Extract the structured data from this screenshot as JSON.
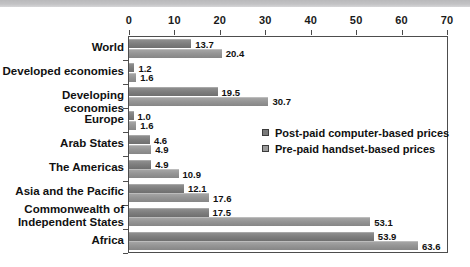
{
  "chart_data": {
    "type": "bar",
    "orientation": "horizontal",
    "title": "",
    "subtitle": "",
    "xlabel": "",
    "ylabel": "",
    "xlim": [
      0,
      70
    ],
    "xticks": [
      0,
      10,
      20,
      30,
      40,
      50,
      60,
      70
    ],
    "xtick_labels": [
      "0",
      "10",
      "20",
      "30",
      "40",
      "50",
      "60",
      "70"
    ],
    "grid": false,
    "legend_position": "inside-right",
    "categories": [
      "World",
      "Developed economies",
      "Developing economies",
      "Europe",
      "Arab States",
      "The Americas",
      "Asia and the Pacific",
      "Commonwealth of\nIndependent States",
      "Africa"
    ],
    "series": [
      {
        "name": "Post-paid computer-based prices",
        "color": "#7a7a7a",
        "values": [
          13.7,
          1.2,
          19.5,
          1.0,
          4.6,
          4.9,
          12.1,
          17.5,
          53.9
        ],
        "value_labels": [
          "13.7",
          "1.2",
          "19.5",
          "1.0",
          "4.6",
          "4.9",
          "12.1",
          "17.5",
          "53.9"
        ]
      },
      {
        "name": "Pre-paid handset-based prices",
        "color": "#9b9b9b",
        "values": [
          20.4,
          1.6,
          30.7,
          1.6,
          4.9,
          10.9,
          17.6,
          53.1,
          63.6
        ],
        "value_labels": [
          "20.4",
          "1.6",
          "30.7",
          "1.6",
          "4.9",
          "10.9",
          "17.6",
          "53.1",
          "63.6"
        ]
      }
    ]
  },
  "legend": {
    "items": [
      {
        "label": "Post-paid computer-based prices",
        "swatch": "post"
      },
      {
        "label": "Pre-paid handset-based prices",
        "swatch": "pre"
      }
    ]
  },
  "colors": {
    "bar_post": "#7a7a7a",
    "bar_pre": "#9b9b9b",
    "frame": "#4d4d4d",
    "text": "#111111",
    "top_band": "#c3c3c5"
  }
}
